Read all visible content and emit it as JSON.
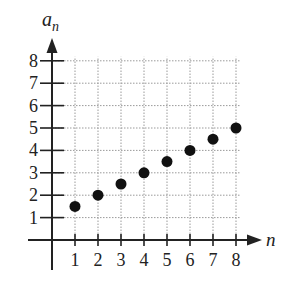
{
  "chart_data": {
    "type": "scatter",
    "title": "",
    "xlabel": "n",
    "ylabel": "a_n",
    "ylabel_base": "a",
    "ylabel_sub": "n",
    "x": [
      1,
      2,
      3,
      4,
      5,
      6,
      7,
      8
    ],
    "series": [
      {
        "name": "a_n",
        "values": [
          1.5,
          2,
          2.5,
          3,
          3.5,
          4,
          4.5,
          5
        ]
      }
    ],
    "x_ticks": [
      "1",
      "2",
      "3",
      "4",
      "5",
      "6",
      "7",
      "8"
    ],
    "y_ticks": [
      "1",
      "2",
      "3",
      "4",
      "5",
      "6",
      "7",
      "8"
    ],
    "xlim": [
      0,
      8
    ],
    "ylim": [
      0,
      8
    ],
    "grid": true,
    "grid_style": "dotted",
    "legend": false,
    "colors": {
      "axis": "#222222",
      "grid": "#9a9a9a",
      "point": "#111111"
    }
  }
}
